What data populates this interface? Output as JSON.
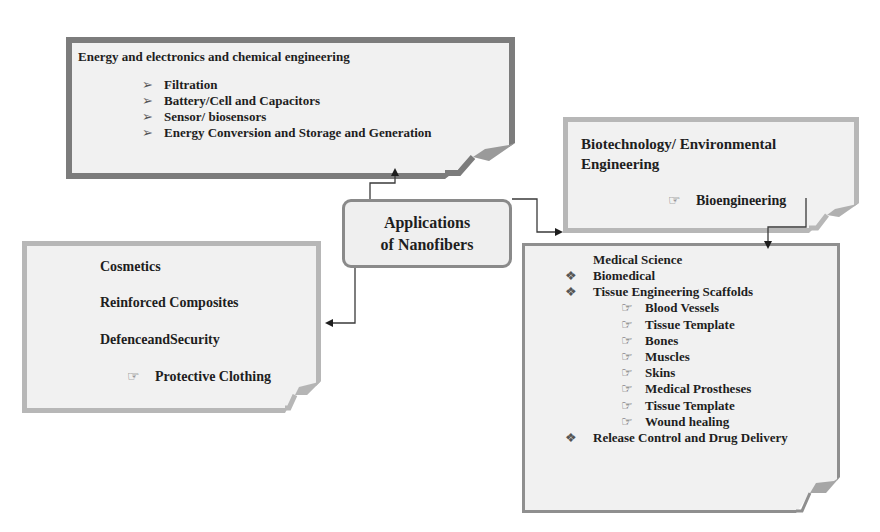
{
  "diagram": {
    "center": {
      "line1": "Applications",
      "line2": "of Nanofibers"
    },
    "energy_box": {
      "title": "Energy and electronics and chemical engineering",
      "bullet_icon": "arrowhead-bullet",
      "items": [
        "Filtration",
        "Battery/Cell and Capacitors",
        "Sensor/ biosensors",
        "Energy Conversion and Storage and Generation"
      ]
    },
    "biotech_box": {
      "title_line1": "Biotechnology/ Environmental",
      "title_line2": "Engineering",
      "bullet_icon": "hand-pointer-bullet",
      "items": [
        "Bioengineering"
      ]
    },
    "misc_box": {
      "items": [
        "Cosmetics",
        "Reinforced Composites",
        "DefenceandSecurity"
      ],
      "sub_bullet_icon": "hand-pointer-bullet",
      "sub_items": [
        "Protective Clothing"
      ]
    },
    "medical_box": {
      "title": "Medical Science",
      "bullet_icon": "diamond-bullet",
      "sub_bullet_icon": "hand-pointer-bullet",
      "items": [
        {
          "label": "Biomedical",
          "level": 1
        },
        {
          "label": "Tissue Engineering Scaffolds",
          "level": 1
        },
        {
          "label": "Blood Vessels",
          "level": 2
        },
        {
          "label": "Tissue Template",
          "level": 2
        },
        {
          "label": "Bones",
          "level": 2
        },
        {
          "label": "Muscles",
          "level": 2
        },
        {
          "label": "Skins",
          "level": 2
        },
        {
          "label": "Medical Prostheses",
          "level": 2
        },
        {
          "label": "Tissue Template",
          "level": 2
        },
        {
          "label": "Wound healing",
          "level": 2
        },
        {
          "label": "Release Control and Drug Delivery",
          "level": 1
        }
      ]
    },
    "colors": {
      "box_fill": "#f1f1f1",
      "dark_border": "#7c7c7c",
      "light_border": "#b7b7b7",
      "connector": "#3a3a3a"
    }
  }
}
